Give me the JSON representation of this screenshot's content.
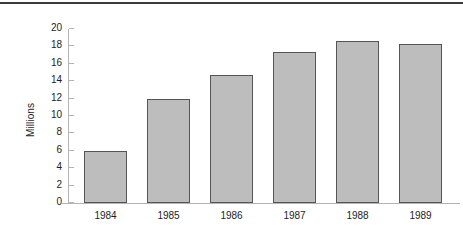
{
  "chart_data": {
    "type": "bar",
    "title": "",
    "subtitle": "",
    "xlabel": "",
    "ylabel": "Millions",
    "categories": [
      "1984",
      "1985",
      "1986",
      "1987",
      "1988",
      "1989"
    ],
    "values": [
      6.0,
      12.0,
      14.7,
      17.4,
      18.6,
      18.3
    ],
    "ylim": [
      0,
      20
    ],
    "ytick_labels": [
      "20",
      "18",
      "16",
      "14",
      "12",
      "10",
      "8",
      "6",
      "4",
      "2",
      "0"
    ],
    "ytick_values": [
      20,
      18,
      16,
      14,
      12,
      10,
      8,
      6,
      4,
      2,
      0
    ],
    "grid": false,
    "legend": null,
    "series": [
      {
        "name": "Millions",
        "values": [
          6.0,
          12.0,
          14.7,
          17.4,
          18.6,
          18.3
        ]
      }
    ],
    "colors": {
      "bar_fill": "#bdbdbd",
      "bar_border": "#555555",
      "axis": "#b4b4b4",
      "text": "#1d1d1d",
      "top_rule": "#3a3a3a",
      "background": "#ffffff"
    }
  }
}
